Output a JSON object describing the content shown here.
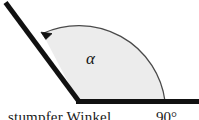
{
  "figure": {
    "name": "obtuse-angle-diagram",
    "background_color": "#ffffff",
    "sector_fill_color": "#ececec",
    "sector_outline_color": "#555555",
    "ray_color": "#111111",
    "angle_label": "α",
    "vertex": {
      "x": 78,
      "y": 101
    },
    "horizontal_ray_end": {
      "x": 199,
      "y": 101
    },
    "diagonal_ray_end": {
      "x": 5,
      "y": 3
    },
    "arc_radius": 87,
    "arrow_marker": "arc-direction-arrowhead"
  },
  "caption": {
    "text": "stumpfer Winkel",
    "angle_value": "90°"
  }
}
